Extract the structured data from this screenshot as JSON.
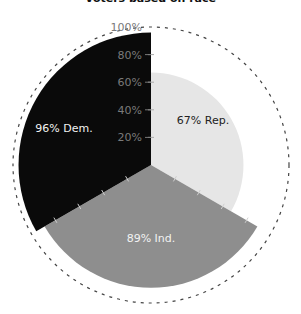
{
  "chart_data": {
    "type": "pie",
    "subtype": "polar-area",
    "title": "Voters based on race",
    "categories": [
      "Rep.",
      "Ind.",
      "Dem."
    ],
    "values": [
      67,
      89,
      96
    ],
    "labels": [
      "67% Rep.",
      "89% Ind.",
      "96% Dem."
    ],
    "colors": [
      "#e6e6e6",
      "#8e8e8e",
      "#0a0a0a"
    ],
    "label_colors": [
      "#222222",
      "#f2f2f2",
      "#f2f2f2"
    ],
    "radial_axis": {
      "ticks": [
        "20%",
        "40%",
        "60%",
        "80%",
        "100%"
      ],
      "tick_values": [
        20,
        40,
        60,
        80,
        100
      ],
      "range": [
        0,
        100
      ]
    },
    "outer_ring": "dashed 100% circle"
  }
}
